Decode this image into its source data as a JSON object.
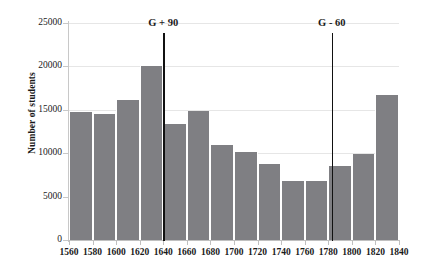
{
  "chart_data": {
    "type": "bar",
    "title": "",
    "subtitle": "",
    "xlabel": "",
    "ylabel": "Number of students",
    "categories": [
      "1560",
      "1580",
      "1600",
      "1620",
      "1640",
      "1660",
      "1680",
      "1700",
      "1720",
      "1740",
      "1760",
      "1780",
      "1800",
      "1820"
    ],
    "bin_edges": [
      1560,
      1580,
      1600,
      1620,
      1640,
      1660,
      1680,
      1700,
      1720,
      1740,
      1760,
      1780,
      1800,
      1820,
      1840
    ],
    "values": [
      14700,
      14500,
      16100,
      20000,
      13400,
      14900,
      10900,
      10100,
      8800,
      6800,
      6800,
      8500,
      9950,
      16700
    ],
    "xlim": [
      1560,
      1840
    ],
    "ylim": [
      0,
      25000
    ],
    "x_ticks": [
      "1560",
      "1580",
      "1600",
      "1620",
      "1640",
      "1660",
      "1680",
      "1700",
      "1720",
      "1740",
      "1760",
      "1780",
      "1800",
      "1820",
      "1840"
    ],
    "x_tick_values": [
      1560,
      1580,
      1600,
      1620,
      1640,
      1660,
      1680,
      1700,
      1720,
      1740,
      1760,
      1780,
      1800,
      1820,
      1840
    ],
    "y_ticks": [
      "0",
      "5000",
      "10000",
      "15000",
      "20000",
      "25000"
    ],
    "y_tick_values": [
      0,
      5000,
      10000,
      15000,
      20000,
      25000
    ],
    "grid": true,
    "legend": null,
    "bar_color": "#7f7f83",
    "annotation_color": "#111111",
    "annotations": [
      {
        "label": "G + 90",
        "x": 1640
      },
      {
        "label": "G - 60",
        "x": 1783
      }
    ]
  }
}
